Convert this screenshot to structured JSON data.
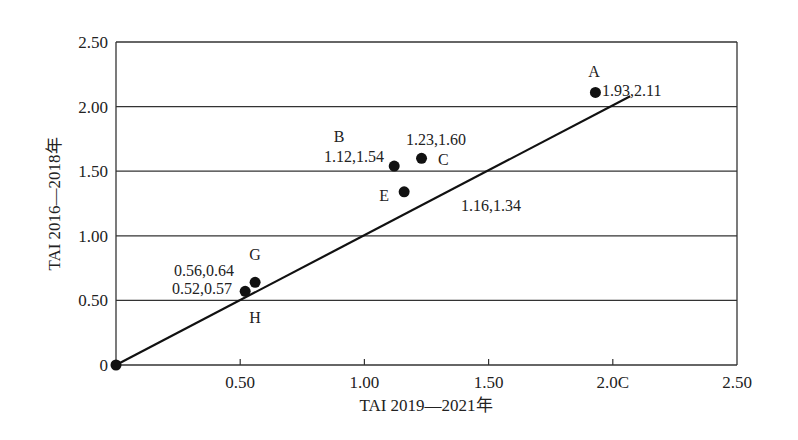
{
  "chart_data": {
    "type": "scatter",
    "title": "",
    "xlabel": "TAI 2019—2021年",
    "ylabel": "TAI 2016—2018年",
    "xlim": [
      0,
      2.5
    ],
    "ylim": [
      0,
      2.5
    ],
    "x_ticks": [
      {
        "value": 0.5,
        "label": "0.50"
      },
      {
        "value": 1.0,
        "label": "1.00"
      },
      {
        "value": 1.5,
        "label": "1.50"
      },
      {
        "value": 2.0,
        "label": "2.0C"
      },
      {
        "value": 2.5,
        "label": "2.50"
      }
    ],
    "y_ticks": [
      {
        "value": 0,
        "label": "0"
      },
      {
        "value": 0.5,
        "label": "0.50"
      },
      {
        "value": 1.0,
        "label": "1.00"
      },
      {
        "value": 1.5,
        "label": "1.50"
      },
      {
        "value": 2.0,
        "label": "2.00"
      },
      {
        "value": 2.5,
        "label": "2.50"
      }
    ],
    "grid": {
      "horizontal": true,
      "vertical": false
    },
    "legend": null,
    "points": [
      {
        "name": "A",
        "x": 1.93,
        "y": 2.11,
        "value_label": "1.93,2.11"
      },
      {
        "name": "B",
        "x": 1.12,
        "y": 1.54,
        "value_label": "1.12,1.54"
      },
      {
        "name": "C",
        "x": 1.23,
        "y": 1.6,
        "value_label": "1.23,1.60"
      },
      {
        "name": "E",
        "x": 1.16,
        "y": 1.34,
        "value_label": "1.16,1.34"
      },
      {
        "name": "G",
        "x": 0.56,
        "y": 0.64,
        "value_label": "0.56,0.64"
      },
      {
        "name": "H",
        "x": 0.52,
        "y": 0.57,
        "value_label": "0.52,0.57"
      },
      {
        "name": "",
        "x": 0,
        "y": 0,
        "value_label": ""
      }
    ],
    "reference_line": {
      "from": [
        0,
        0
      ],
      "to": [
        2.07,
        2.08
      ],
      "description": "y = x diagonal"
    }
  },
  "layout": {
    "plot": {
      "left": 116,
      "top": 42,
      "right": 737,
      "bottom": 365
    },
    "label_positions": {
      "A": {
        "name": [
          594,
          77
        ],
        "value": [
          602,
          96
        ],
        "name_anchor": "middle",
        "value_anchor": "start"
      },
      "B": {
        "name": [
          339,
          142
        ],
        "value": [
          384,
          162
        ],
        "name_anchor": "middle",
        "value_anchor": "end"
      },
      "C": {
        "name": [
          438,
          165
        ],
        "value": [
          436,
          145
        ],
        "name_anchor": "start",
        "value_anchor": "middle"
      },
      "E": {
        "name": [
          389,
          201
        ],
        "value": [
          491,
          211
        ],
        "name_anchor": "end",
        "value_anchor": "middle"
      },
      "G": {
        "name": [
          255,
          260
        ],
        "value": [
          234,
          276
        ],
        "name_anchor": "middle",
        "value_anchor": "end"
      },
      "H": {
        "name": [
          255,
          323
        ],
        "value": [
          232,
          294
        ],
        "name_anchor": "middle",
        "value_anchor": "end"
      }
    }
  }
}
